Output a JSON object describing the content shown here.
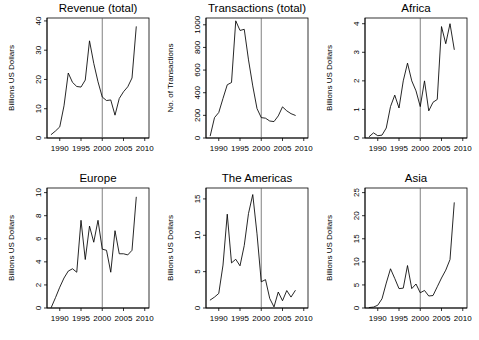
{
  "figure": {
    "caption": "",
    "rows": 2,
    "cols": 3,
    "background": "#ffffff",
    "line_color": "#000000",
    "vline_color": "#555555"
  },
  "chart_data": [
    {
      "type": "line",
      "title": "Revenue (total)",
      "xlabel": "",
      "ylabel": "Billions US Dollars",
      "xlim": [
        1987,
        2011
      ],
      "ylim": [
        0,
        41
      ],
      "xticks": [
        1990,
        1995,
        2000,
        2005,
        2010
      ],
      "yticks": [
        0,
        10,
        20,
        30,
        40
      ],
      "grid": false,
      "legend": "none",
      "annotations": [
        {
          "type": "vline",
          "x": 2000,
          "label": ""
        }
      ],
      "x": [
        1988,
        1989,
        1990,
        1991,
        1992,
        1993,
        1994,
        1995,
        1996,
        1997,
        1998,
        1999,
        2000,
        2001,
        2002,
        2003,
        2004,
        2005,
        2006,
        2007,
        2008
      ],
      "values": [
        1.2,
        2.4,
        3.8,
        11.0,
        22.2,
        19.0,
        17.6,
        17.4,
        19.8,
        33.2,
        25.5,
        19.2,
        14.0,
        12.8,
        13.0,
        7.8,
        13.5,
        15.8,
        17.5,
        20.5,
        38.0
      ]
    },
    {
      "type": "line",
      "title": "Transactions (total)",
      "xlabel": "",
      "ylabel": "No. of Transactions",
      "xlim": [
        1987,
        2011
      ],
      "ylim": [
        0,
        1060
      ],
      "xticks": [
        1990,
        1995,
        2000,
        2005,
        2010
      ],
      "yticks": [
        0,
        200,
        400,
        600,
        800,
        1000
      ],
      "grid": false,
      "legend": "none",
      "annotations": [
        {
          "type": "vline",
          "x": 2000,
          "label": ""
        }
      ],
      "x": [
        1988,
        1989,
        1990,
        1991,
        1992,
        1993,
        1994,
        1995,
        1996,
        1997,
        1998,
        1999,
        2000,
        2001,
        2002,
        2003,
        2004,
        2005,
        2006,
        2007,
        2008
      ],
      "values": [
        20,
        180,
        225,
        350,
        470,
        490,
        1035,
        950,
        960,
        690,
        460,
        260,
        180,
        175,
        150,
        145,
        195,
        275,
        240,
        215,
        200
      ]
    },
    {
      "type": "line",
      "title": "Africa",
      "xlabel": "",
      "ylabel": "Billions US Dollars",
      "xlim": [
        1987,
        2011
      ],
      "ylim": [
        0,
        4.2
      ],
      "xticks": [
        1990,
        1995,
        2000,
        2005,
        2010
      ],
      "yticks": [
        0,
        1,
        2,
        3,
        4
      ],
      "grid": false,
      "legend": "none",
      "annotations": [
        {
          "type": "vline",
          "x": 2000,
          "label": ""
        }
      ],
      "x": [
        1988,
        1989,
        1990,
        1991,
        1992,
        1993,
        1994,
        1995,
        1996,
        1997,
        1998,
        1999,
        2000,
        2001,
        2002,
        2003,
        2004,
        2005,
        2006,
        2007,
        2008
      ],
      "values": [
        0.05,
        0.18,
        0.08,
        0.1,
        0.35,
        1.1,
        1.5,
        1.05,
        2.0,
        2.62,
        2.0,
        1.65,
        1.1,
        2.0,
        0.95,
        1.25,
        1.35,
        3.9,
        3.3,
        4.0,
        3.1
      ]
    },
    {
      "type": "line",
      "title": "Europe",
      "xlabel": "",
      "ylabel": "Billions US Dollars",
      "xlim": [
        1987,
        2011
      ],
      "ylim": [
        0,
        10.4
      ],
      "xticks": [
        1990,
        1995,
        2000,
        2005,
        2010
      ],
      "yticks": [
        0,
        2,
        4,
        6,
        8,
        10
      ],
      "grid": false,
      "legend": "none",
      "annotations": [
        {
          "type": "vline",
          "x": 2000,
          "label": ""
        }
      ],
      "x": [
        1988,
        1989,
        1990,
        1991,
        1992,
        1993,
        1994,
        1995,
        1996,
        1997,
        1998,
        1999,
        2000,
        2001,
        2002,
        2003,
        2004,
        2005,
        2006,
        2007,
        2008
      ],
      "values": [
        0.05,
        0.9,
        1.8,
        2.6,
        3.2,
        3.4,
        3.1,
        7.6,
        4.2,
        7.1,
        5.7,
        7.6,
        5.1,
        5.0,
        3.1,
        6.7,
        4.7,
        4.7,
        4.6,
        5.0,
        9.6
      ]
    },
    {
      "type": "line",
      "title": "The Americas",
      "xlabel": "",
      "ylabel": "Billions US Dollars",
      "xlim": [
        1987,
        2011
      ],
      "ylim": [
        0,
        16.5
      ],
      "xticks": [
        1990,
        1995,
        2000,
        2005,
        2010
      ],
      "yticks": [
        0,
        5,
        10,
        15
      ],
      "grid": false,
      "legend": "none",
      "annotations": [
        {
          "type": "vline",
          "x": 2000,
          "label": ""
        }
      ],
      "x": [
        1988,
        1989,
        1990,
        1991,
        1992,
        1993,
        1994,
        1995,
        1996,
        1997,
        1998,
        1999,
        2000,
        2001,
        2002,
        2003,
        2004,
        2005,
        2006,
        2007,
        2008
      ],
      "values": [
        1.1,
        1.5,
        2.0,
        5.9,
        12.9,
        6.2,
        6.7,
        5.8,
        8.6,
        13.0,
        15.6,
        10.2,
        3.6,
        3.9,
        1.3,
        0.15,
        2.2,
        1.0,
        2.4,
        1.5,
        2.4
      ]
    },
    {
      "type": "line",
      "title": "Asia",
      "xlabel": "",
      "ylabel": "Billions US Dollars",
      "xlim": [
        1987,
        2011
      ],
      "ylim": [
        0,
        26
      ],
      "xticks": [
        1990,
        1995,
        2000,
        2005,
        2010
      ],
      "yticks": [
        0,
        5,
        10,
        15,
        20,
        25
      ],
      "grid": false,
      "legend": "none",
      "annotations": [
        {
          "type": "vline",
          "x": 2000,
          "label": ""
        }
      ],
      "x": [
        1988,
        1989,
        1990,
        1991,
        1992,
        1993,
        1994,
        1995,
        1996,
        1997,
        1998,
        1999,
        2000,
        2001,
        2002,
        2003,
        2004,
        2005,
        2006,
        2007,
        2008
      ],
      "values": [
        0.1,
        0.2,
        0.6,
        2.0,
        5.4,
        8.5,
        6.4,
        4.2,
        4.3,
        9.2,
        4.2,
        5.2,
        3.3,
        3.8,
        2.6,
        2.7,
        4.6,
        6.5,
        8.2,
        10.5,
        22.8
      ]
    }
  ]
}
